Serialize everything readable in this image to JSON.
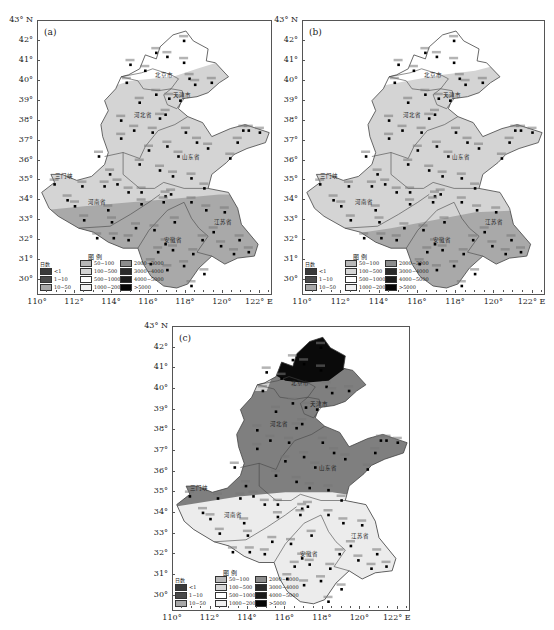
{
  "figure": {
    "panels": [
      {
        "id": "a",
        "label": "(a)"
      },
      {
        "id": "b",
        "label": "(b)"
      },
      {
        "id": "c",
        "label": "(c)"
      }
    ],
    "y_ticks": [
      "43° N",
      "42°",
      "41°",
      "40°",
      "39°",
      "38°",
      "37°",
      "36°",
      "35°",
      "34°",
      "33°",
      "32°",
      "31°",
      "30°"
    ],
    "x_ticks": [
      "110°",
      "112°",
      "114°",
      "116°",
      "118°",
      "120°",
      "122° E"
    ],
    "legend": {
      "title": "图 例",
      "unit_label": "日数",
      "items": [
        {
          "label": "<1",
          "color": "#3a3a3a"
        },
        {
          "label": "1~10",
          "color": "#4a4a4a"
        },
        {
          "label": "10~50",
          "color": "#a8a8a8"
        },
        {
          "label": "50~100",
          "color": "#b8b8b8"
        },
        {
          "label": "100~500",
          "color": "#d6d6d6"
        },
        {
          "label": "500~1000",
          "color": "#ffffff"
        },
        {
          "label": "1000~2000",
          "color": "#f0f0f0"
        },
        {
          "label": "2000~3000",
          "color": "#8c8c8c"
        },
        {
          "label": "3000~4000",
          "color": "#2a2a2a"
        },
        {
          "label": "4000~5000",
          "color": "#1a1a1a"
        },
        {
          "label": ">5000",
          "color": "#050505"
        }
      ]
    },
    "place_labels": {
      "beijing": "北京市",
      "tianjin": "天津市",
      "hebei": "河北省",
      "shandong": "山东省",
      "henan": "河南省",
      "anhui": "安徽省",
      "jiangsu": "江苏省",
      "shijiazhuang": "石家庄",
      "zhangjiakou": "张家口",
      "chengde": "承德",
      "qinhuangdao": "秦皇岛",
      "sanmenxia": "三门峡",
      "zhumadian": "驻马店",
      "yantai": "烟台",
      "chengshantou": "成山头"
    },
    "colors": {
      "light_region": "#d4d4d4",
      "mid_region": "#a9a9a9",
      "dark_region_c": "#7f7f7f",
      "very_light_c": "#ececec",
      "black_region_c": "#0a0a0a",
      "white_region": "#ffffff",
      "border": "#555555"
    }
  }
}
